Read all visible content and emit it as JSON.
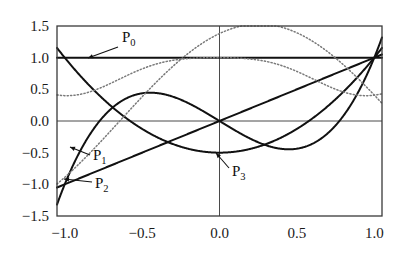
{
  "figure": {
    "background": "#ffffff",
    "frame_color": "#3a3a3a",
    "axis_color": "#4a4a4a",
    "solid_color": "#111111",
    "dotted_color": "#7a7a7a"
  },
  "chart_data": {
    "type": "line",
    "title": "",
    "subtitle": "",
    "xlabel": "",
    "ylabel": "",
    "xlim": [
      -1.05,
      1.05
    ],
    "ylim": [
      -1.5,
      1.5
    ],
    "grid": false,
    "axis_lines": {
      "x_zero": 0.0,
      "y_zero": 0.0
    },
    "legend_position": "inline-annotations",
    "xticks": [
      -1.0,
      -0.5,
      0.0,
      0.5,
      1.0
    ],
    "xticklabels": [
      "−1.0",
      "−0.5",
      "0.0",
      "0.5",
      "1.0"
    ],
    "yticks": [
      -1.5,
      -1.0,
      -0.5,
      0.0,
      0.5,
      1.0,
      1.5
    ],
    "yticklabels": [
      "−1.5",
      "−1.0",
      "−0.5",
      "0.0",
      "0.5",
      "1.0",
      "1.5"
    ],
    "series": [
      {
        "name": "P_0",
        "label": "P",
        "subscript": "0",
        "style": "solid",
        "formula": "1",
        "endpoints": {
          "x_-1": 1.0,
          "x_1": 1.0
        },
        "description": "constant 1.0"
      },
      {
        "name": "P_1",
        "label": "P",
        "subscript": "1",
        "style": "solid",
        "formula": "x",
        "endpoints": {
          "x_-1": -1.0,
          "x_1": 1.0
        },
        "description": "straight line through origin"
      },
      {
        "name": "P_2",
        "label": "P",
        "subscript": "2",
        "style": "solid",
        "formula": "(3x^2 - 1)/2",
        "endpoints": {
          "x_-1": 1.0,
          "x_1": 1.0
        },
        "minimum": {
          "x": 0.0,
          "y": -0.5
        },
        "description": "parabola, min -0.5 at x=0"
      },
      {
        "name": "P_3",
        "label": "P",
        "subscript": "3",
        "style": "solid",
        "formula": "(5x^3 - 3x)/2",
        "endpoints": {
          "x_-1": -1.0,
          "x_1": 1.0
        },
        "maximum": {
          "x": -0.447,
          "y": 0.447
        },
        "minimum": {
          "x": 0.447,
          "y": -0.447
        },
        "description": "cubic, local max 0.45 at x=-0.45"
      },
      {
        "name": "dotted_a",
        "label": "",
        "subscript": "",
        "style": "dotted",
        "endpoints": {
          "x_-1": -1.5,
          "x_1": 0.0
        },
        "maximum": {
          "x": 0.8,
          "y": 1.55
        },
        "minimum": {
          "x": -0.72,
          "y": -1.5
        },
        "description": "dotted sine-like curve rising from -1.5 to peak 1.5 near x=0.8"
      },
      {
        "name": "dotted_b",
        "label": "",
        "subscript": "",
        "style": "dotted",
        "endpoints": {
          "x_-1": 0.15,
          "x_1": 1.0
        },
        "maximum": {
          "x": -0.05,
          "y": 1.02
        },
        "minimum": {
          "x": 0.55,
          "y": 0.52
        },
        "description": "dotted curve from 0.15 rising over 1.0 then dipping and returning to 1.0"
      }
    ],
    "annotations": [
      {
        "name": "P_0",
        "text": "P",
        "sub": "0",
        "label_x": 122,
        "label_y": 42,
        "arrow_from": [
          118,
          47
        ],
        "arrow_to": [
          88,
          58
        ]
      },
      {
        "name": "P_1",
        "text": "P",
        "sub": "1",
        "label_x": 93,
        "label_y": 160,
        "arrow_from": [
          90,
          155
        ],
        "arrow_to": [
          70,
          147
        ]
      },
      {
        "name": "P_2",
        "text": "P",
        "sub": "2",
        "label_x": 95,
        "label_y": 188,
        "arrow_from": [
          92,
          182
        ],
        "arrow_to": [
          64,
          179
        ]
      },
      {
        "name": "P_3",
        "text": "P",
        "sub": "3",
        "label_x": 232,
        "label_y": 176,
        "arrow_from": [
          229,
          168
        ],
        "arrow_to": [
          216,
          153
        ]
      }
    ]
  },
  "plot_box": {
    "left": 57,
    "top": 26,
    "right": 382,
    "bottom": 216
  }
}
